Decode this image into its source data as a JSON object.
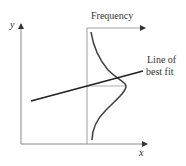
{
  "diagram": {
    "axes": {
      "y_label": "y",
      "x_label": "x"
    },
    "frequency_axis": {
      "label": "Frequency"
    },
    "best_fit": {
      "label_line1": "Line of",
      "label_line2": "best fit"
    },
    "colors": {
      "axis": "#888888",
      "curve": "#444444",
      "fit_line": "#222222",
      "text": "#333333"
    }
  }
}
